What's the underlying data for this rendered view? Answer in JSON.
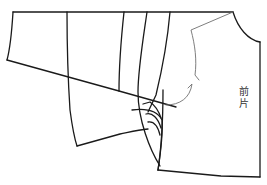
{
  "diagram": {
    "type": "garment-pattern",
    "background": "#ffffff",
    "line_color": "#1a1a1a",
    "guide_line_color": "#6f6f6f",
    "pieces": [
      {
        "name": "front-piece",
        "label": "前片"
      },
      {
        "name": "sleeve-panel-left"
      },
      {
        "name": "sleeve-panel-middle"
      },
      {
        "name": "lapel-folds"
      }
    ],
    "label_text": "前片"
  }
}
